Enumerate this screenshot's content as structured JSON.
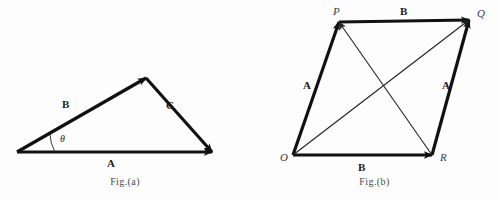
{
  "figure": {
    "background_color": "#fdfdfd",
    "stroke_color": "#111111",
    "thin_stroke_color": "#222222"
  },
  "fig_a": {
    "caption": "Fig.(a)",
    "angle_label": "θ",
    "vectors": [
      {
        "name": "vector-b",
        "label": "B",
        "from": [
          17,
          152
        ],
        "to": [
          146,
          78
        ],
        "label_pos": [
          62,
          99
        ],
        "stroke_width": 3.2
      },
      {
        "name": "vector-c",
        "label": "C",
        "from": [
          146,
          78
        ],
        "to": [
          212,
          152
        ],
        "label_pos": [
          166,
          100
        ],
        "stroke_width": 3.2
      },
      {
        "name": "vector-a",
        "label": "A",
        "from": [
          17,
          152
        ],
        "to": [
          212,
          152
        ],
        "label_pos": [
          107,
          158
        ],
        "stroke_width": 3.2
      }
    ],
    "angle_arc": {
      "vertex": [
        17,
        152
      ],
      "radius": 38,
      "label_pos": [
        60,
        134
      ]
    }
  },
  "fig_b": {
    "caption": "Fig.(b)",
    "points": [
      {
        "name": "point-o",
        "label": "O",
        "pos": [
          43,
          155
        ],
        "label_pos": [
          30,
          152
        ]
      },
      {
        "name": "point-p",
        "label": "P",
        "pos": [
          89,
          22
        ],
        "label_pos": [
          83,
          6
        ]
      },
      {
        "name": "point-q",
        "label": "Q",
        "pos": [
          219,
          20
        ],
        "label_pos": [
          227,
          8
        ]
      },
      {
        "name": "point-r",
        "label": "R",
        "pos": [
          182,
          155
        ],
        "label_pos": [
          190,
          152
        ]
      }
    ],
    "vectors": [
      {
        "name": "vector-a-left",
        "label": "A",
        "from": [
          43,
          155
        ],
        "to": [
          89,
          22
        ],
        "label_pos": [
          53,
          80
        ],
        "stroke_width": 3.2,
        "kind": "thick"
      },
      {
        "name": "vector-b-top",
        "label": "B",
        "from": [
          89,
          22
        ],
        "to": [
          219,
          20
        ],
        "label_pos": [
          150,
          6
        ],
        "stroke_width": 3.2,
        "kind": "thick"
      },
      {
        "name": "vector-b-bottom",
        "label": "B",
        "from": [
          43,
          155
        ],
        "to": [
          182,
          155
        ],
        "label_pos": [
          108,
          162
        ],
        "stroke_width": 3.2,
        "kind": "thick"
      },
      {
        "name": "vector-a-right",
        "label": "A",
        "from": [
          182,
          155
        ],
        "to": [
          219,
          20
        ],
        "label_pos": [
          192,
          80
        ],
        "stroke_width": 3.2,
        "kind": "thick"
      },
      {
        "name": "diagonal-o-to-q",
        "label": "",
        "from": [
          43,
          155
        ],
        "to": [
          219,
          20
        ],
        "label_pos": [
          0,
          0
        ],
        "stroke_width": 1.1,
        "kind": "thin"
      },
      {
        "name": "diagonal-r-to-p",
        "label": "",
        "from": [
          182,
          155
        ],
        "to": [
          89,
          22
        ],
        "label_pos": [
          0,
          0
        ],
        "stroke_width": 1.1,
        "kind": "thin"
      }
    ]
  }
}
